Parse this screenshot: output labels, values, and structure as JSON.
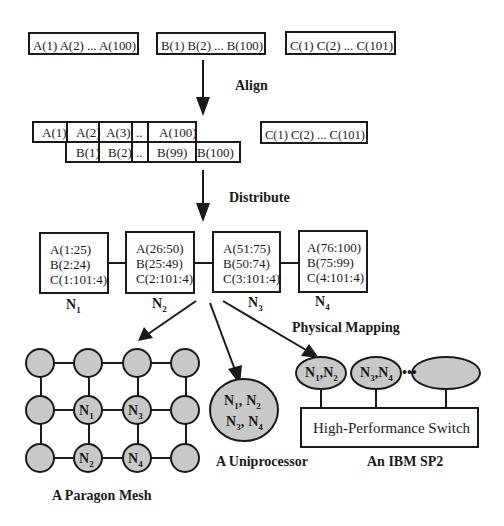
{
  "colors": {
    "stroke": "#1a1a1a",
    "node_fill": "#c8c8c8",
    "background": "#ffffff"
  },
  "stage1": {
    "arrays": [
      {
        "label": "A(1) A(2) ... A(100)"
      },
      {
        "label": "B(1) B(2) ... B(100)"
      },
      {
        "label": "C(1) C(2) ... C(101)"
      }
    ]
  },
  "steps": {
    "align": "Align",
    "distribute": "Distribute",
    "physical_mapping": "Physical Mapping"
  },
  "stage2": {
    "a_row": [
      "A(1)",
      "A(2)",
      "A(3)",
      "..",
      "A(100)"
    ],
    "b_row": [
      "B(1)",
      "B(2)",
      "..",
      "B(99)",
      "B(100)"
    ],
    "c_array": "C(1) C(2) ... C(101)"
  },
  "stage3": {
    "nodes": [
      {
        "name": "N",
        "sub": "1",
        "lines": [
          "A(1:25)",
          "B(2:24)",
          "C(1:101:4)"
        ]
      },
      {
        "name": "N",
        "sub": "2",
        "lines": [
          "A(26:50)",
          "B(25:49)",
          "C(2:101:4)"
        ]
      },
      {
        "name": "N",
        "sub": "3",
        "lines": [
          "A(51:75)",
          "B(50:74)",
          "C(3:101:4)"
        ]
      },
      {
        "name": "N",
        "sub": "4",
        "lines": [
          "A(76:100)",
          "B(75:99)",
          "C(4:101:4)"
        ]
      }
    ]
  },
  "targets": {
    "mesh": {
      "caption": "A Paragon Mesh",
      "rows": 3,
      "cols": 4,
      "labeled": [
        {
          "row": 1,
          "col": 1,
          "name": "N",
          "sub": "1"
        },
        {
          "row": 1,
          "col": 2,
          "name": "N",
          "sub": "3"
        },
        {
          "row": 2,
          "col": 1,
          "name": "N",
          "sub": "2"
        },
        {
          "row": 2,
          "col": 2,
          "name": "N",
          "sub": "4"
        }
      ]
    },
    "uniprocessor": {
      "caption": "A Uniprocessor",
      "line1": {
        "a": "N",
        "a_sub": "1",
        "sep": ",",
        "b": "N",
        "b_sub": "2"
      },
      "line2": {
        "a": "N",
        "a_sub": "3",
        "sep": ",",
        "b": "N",
        "b_sub": "4"
      }
    },
    "sp2": {
      "caption": "An IBM SP2",
      "switch_label": "High-Performance Switch",
      "ellipsis": "•••",
      "nodes": [
        {
          "a": "N",
          "a_sub": "1",
          "sep": ",",
          "b": "N",
          "b_sub": "2"
        },
        {
          "a": "N",
          "a_sub": "3",
          "sep": ",",
          "b": "N",
          "b_sub": "4"
        },
        {
          "a": "",
          "a_sub": "",
          "sep": "",
          "b": "",
          "b_sub": ""
        }
      ]
    }
  }
}
